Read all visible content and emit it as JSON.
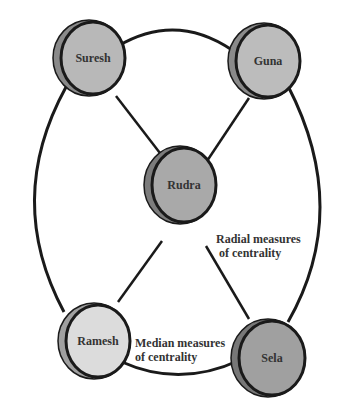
{
  "diagram": {
    "type": "network",
    "nodes": [
      {
        "id": "suresh",
        "label": "Suresh",
        "cx": 89,
        "cy": 58,
        "fill": "#b8b8b8",
        "side": "#8a8a8a"
      },
      {
        "id": "guna",
        "label": "Guna",
        "cx": 264,
        "cy": 61,
        "fill": "#bcbcbc",
        "side": "#8a8a8a"
      },
      {
        "id": "rudra",
        "label": "Rudra",
        "cx": 182,
        "cy": 185,
        "fill": "#a9a9a9",
        "side": "#7c7c7c"
      },
      {
        "id": "ramesh",
        "label": "Ramesh",
        "cx": 95,
        "cy": 341,
        "fill": "#dcdcdc",
        "side": "#a0a0a0"
      },
      {
        "id": "sela",
        "label": "Sela",
        "cx": 270,
        "cy": 358,
        "fill": "#a0a0a0",
        "side": "#777777"
      }
    ],
    "edges": [
      {
        "from": "suresh",
        "to": "rudra",
        "kind": "radial"
      },
      {
        "from": "guna",
        "to": "rudra",
        "kind": "radial"
      },
      {
        "from": "ramesh",
        "to": "rudra",
        "kind": "radial"
      },
      {
        "from": "sela",
        "to": "rudra",
        "kind": "radial"
      },
      {
        "from": "suresh",
        "to": "guna",
        "kind": "ring"
      },
      {
        "from": "guna",
        "to": "sela",
        "kind": "ring"
      },
      {
        "from": "sela",
        "to": "ramesh",
        "kind": "ring"
      },
      {
        "from": "ramesh",
        "to": "suresh",
        "kind": "ring"
      }
    ],
    "annotations": {
      "radial": [
        "Radial measures",
        "of centrality"
      ],
      "median": [
        "Median measures",
        "of centrality"
      ]
    },
    "colors": {
      "stroke": "#1a1a1a",
      "text": "#333333",
      "background": "#ffffff"
    }
  }
}
